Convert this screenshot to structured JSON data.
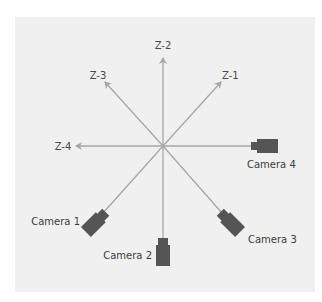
{
  "diagram": {
    "title": "",
    "center": {
      "x": 163,
      "y": 146
    },
    "colors": {
      "background": "#ffffff",
      "panel": "#f0f0f0",
      "axis": "#a6a6a6",
      "camera": "#555555",
      "text": "#444444"
    },
    "axes": [
      {
        "id": "z1",
        "label": "Z-1",
        "direction": "up-right"
      },
      {
        "id": "z2",
        "label": "Z-2",
        "direction": "up"
      },
      {
        "id": "z3",
        "label": "Z-3",
        "direction": "up-left"
      },
      {
        "id": "z4",
        "label": "Z-4",
        "direction": "left"
      }
    ],
    "cameras": [
      {
        "id": "camera1",
        "label": "Camera 1",
        "direction": "down-left"
      },
      {
        "id": "camera2",
        "label": "Camera 2",
        "direction": "down"
      },
      {
        "id": "camera3",
        "label": "Camera 3",
        "direction": "down-right"
      },
      {
        "id": "camera4",
        "label": "Camera 4",
        "direction": "right"
      }
    ]
  }
}
